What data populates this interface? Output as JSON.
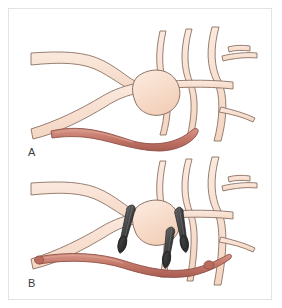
{
  "figure": {
    "background_color": "#ffffff",
    "frame_color": "#e3e3e3",
    "panel_count": 2
  },
  "colors": {
    "vessel_fill": "#f7dccb",
    "vessel_fill_light": "#fbe8dc",
    "vessel_outline": "#8a7264",
    "aneurysm_fill": "#f6d6c2",
    "graft_fill": "#c4786a",
    "graft_outline": "#8d4f45",
    "graft_highlight": "#d9988a",
    "clip_fill": "#4a4a4a",
    "clip_outline": "#2b2b2b",
    "label_color": "#3a3a3a"
  },
  "panels": [
    {
      "id": "panel-a",
      "label": "A",
      "caption": "Aneurysm at vessel bifurcation with harvested free graft vessel positioned below, prior to anastomosis",
      "stage": "pre-operative",
      "elements": {
        "aneurysm": {
          "name": "aneurysm-dome",
          "shape": "saccular",
          "present": true,
          "clipped": false
        },
        "parent_vessels": {
          "name": "parent-artery-branches",
          "count": 2,
          "direction": "from-left"
        },
        "distal_branches": {
          "name": "distal-vessel-network",
          "count": 6,
          "direction": "to-right"
        },
        "graft": {
          "name": "bypass-graft-vessel",
          "state": "free",
          "attached": false,
          "ends": [
            "free-proximal-end",
            "free-distal-end"
          ]
        },
        "clips": {
          "name": "aneurysm-clips",
          "count": 0
        }
      }
    },
    {
      "id": "panel-b",
      "label": "B",
      "caption": "Aneurysm occluded with surgical clips and bypass graft anastomosed between proximal and distal vessels",
      "stage": "post-operative",
      "elements": {
        "aneurysm": {
          "name": "aneurysm-dome",
          "shape": "saccular",
          "present": true,
          "clipped": true
        },
        "parent_vessels": {
          "name": "parent-artery-branches",
          "count": 2,
          "direction": "from-left"
        },
        "distal_branches": {
          "name": "distal-vessel-network",
          "count": 6,
          "direction": "to-right"
        },
        "graft": {
          "name": "bypass-graft-vessel",
          "state": "anastomosed",
          "attached": true,
          "ends": [
            "proximal-anastomosis",
            "distal-anastomosis"
          ]
        },
        "clips": {
          "name": "aneurysm-clips",
          "count": 3,
          "positions": [
            "left-neck",
            "right-neck-upper",
            "right-neck-lower"
          ]
        }
      }
    }
  ]
}
